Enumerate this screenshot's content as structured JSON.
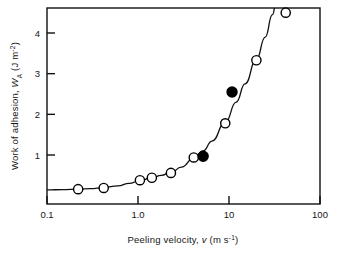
{
  "chart_data": {
    "type": "scatter",
    "title": "",
    "xlabel": "Peeling velocity, v (m s⁻¹)",
    "xlabel_parts": {
      "text_before": "Peeling  velocity,",
      "symbol": "v",
      "units_open": "(m s",
      "units_exp": "-1",
      "units_close": ")"
    },
    "ylabel": "Work of adhesion, W_A (J m⁻²)",
    "ylabel_parts": {
      "text_before": "Work of adhesion,",
      "symbol": "W",
      "symbol_sub": "A",
      "units_open": "(J m",
      "units_exp": "-2",
      "units_close": ")"
    },
    "xscale": "log",
    "yscale": "linear",
    "xlim": [
      0.1,
      100
    ],
    "ylim": [
      0,
      4.8
    ],
    "xticks": [
      0.1,
      1.0,
      10,
      100
    ],
    "xtick_labels": [
      "0.1",
      "1.0",
      "10",
      "100"
    ],
    "yticks": [
      1,
      2,
      3,
      4
    ],
    "ytick_labels": [
      "1",
      "2",
      "3",
      "4"
    ],
    "grid": false,
    "legend_position": "none",
    "series": [
      {
        "name": "open-circles",
        "marker": "open-circle",
        "color": "#000000",
        "points": [
          {
            "x": 0.22,
            "y": 0.16
          },
          {
            "x": 0.42,
            "y": 0.19
          },
          {
            "x": 1.05,
            "y": 0.38
          },
          {
            "x": 1.42,
            "y": 0.44
          },
          {
            "x": 2.3,
            "y": 0.56
          },
          {
            "x": 4.1,
            "y": 0.94
          },
          {
            "x": 9.1,
            "y": 1.78
          },
          {
            "x": 20.0,
            "y": 3.33
          },
          {
            "x": 42.0,
            "y": 4.5
          }
        ]
      },
      {
        "name": "filled-circles",
        "marker": "filled-circle",
        "color": "#000000",
        "points": [
          {
            "x": 5.2,
            "y": 0.97
          },
          {
            "x": 10.8,
            "y": 2.55
          }
        ]
      }
    ],
    "fit_curve": {
      "name": "fitted-curve",
      "points": [
        {
          "x": 0.1,
          "y": 0.14
        },
        {
          "x": 0.15,
          "y": 0.15
        },
        {
          "x": 0.22,
          "y": 0.16
        },
        {
          "x": 0.3,
          "y": 0.175
        },
        {
          "x": 0.42,
          "y": 0.2
        },
        {
          "x": 0.6,
          "y": 0.24
        },
        {
          "x": 0.8,
          "y": 0.3
        },
        {
          "x": 1.05,
          "y": 0.37
        },
        {
          "x": 1.42,
          "y": 0.44
        },
        {
          "x": 1.8,
          "y": 0.5
        },
        {
          "x": 2.3,
          "y": 0.57
        },
        {
          "x": 3.0,
          "y": 0.7
        },
        {
          "x": 4.1,
          "y": 0.92
        },
        {
          "x": 5.2,
          "y": 1.1
        },
        {
          "x": 6.5,
          "y": 1.34
        },
        {
          "x": 9.1,
          "y": 1.8
        },
        {
          "x": 12.0,
          "y": 2.3
        },
        {
          "x": 15.0,
          "y": 2.75
        },
        {
          "x": 20.0,
          "y": 3.35
        },
        {
          "x": 25.0,
          "y": 3.9
        },
        {
          "x": 30.0,
          "y": 4.45
        },
        {
          "x": 33.0,
          "y": 4.75
        }
      ]
    }
  }
}
